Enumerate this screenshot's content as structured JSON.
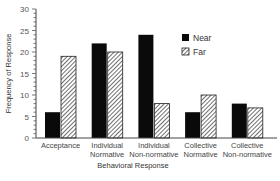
{
  "chart_data": {
    "type": "bar",
    "title": "",
    "xlabel": "Behavioral Response",
    "ylabel": "Frequency of Response",
    "ylim": [
      0,
      30
    ],
    "yticks": [
      0,
      5,
      10,
      15,
      20,
      25,
      30
    ],
    "grid": false,
    "legend_position": "upper right (inside plot)",
    "categories": [
      [
        "Acceptance"
      ],
      [
        "Individual",
        "Normative"
      ],
      [
        "Individual",
        "Non-normative"
      ],
      [
        "Collective",
        "Normative"
      ],
      [
        "Collective",
        "Non-normative"
      ]
    ],
    "series": [
      {
        "name": "Near",
        "fill": "solid",
        "color": "#000000",
        "values": [
          6,
          22,
          24,
          6,
          8
        ]
      },
      {
        "name": "Far",
        "fill": "hatched",
        "color": "#ffffff",
        "values": [
          19,
          20,
          8,
          10,
          7
        ]
      }
    ]
  }
}
